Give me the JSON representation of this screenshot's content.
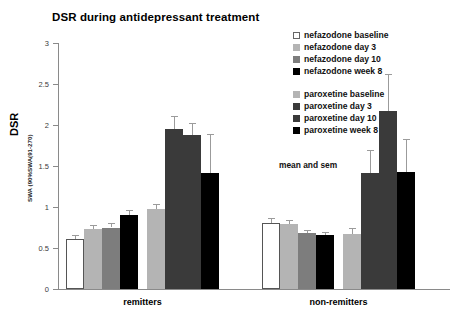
{
  "chart_data": {
    "type": "bar",
    "title": "DSR during antidepressant treatment",
    "xlabel": "",
    "ylabel": "DSR",
    "ylabel_sub": "SWA (90%SWA(91-270)",
    "ylim": [
      0,
      3
    ],
    "yticks": [
      "0",
      "0.5",
      "1",
      "1.5",
      "2",
      "2.5",
      "3"
    ],
    "ytick_values": [
      0,
      0.5,
      1,
      1.5,
      2,
      2.5,
      3
    ],
    "grid": false,
    "legend_position": "top-right",
    "annotation": "mean and sem",
    "categories": [
      "remitters",
      "non-remitters"
    ],
    "series": [
      {
        "name": "nefazodone baseline",
        "color": "#ffffff",
        "border": "#555555",
        "values": [
          0.61,
          0.8
        ],
        "errors": [
          0.05,
          0.06
        ]
      },
      {
        "name": "nefazodone day 3",
        "color": "#b4b4b4",
        "border": "#b4b4b4",
        "values": [
          0.73,
          0.79
        ],
        "errors": [
          0.05,
          0.05
        ]
      },
      {
        "name": "nefazodone day 10",
        "color": "#7d7d7d",
        "border": "#7d7d7d",
        "values": [
          0.75,
          0.68
        ],
        "errors": [
          0.05,
          0.04
        ]
      },
      {
        "name": "nefazodone week 8",
        "color": "#000000",
        "border": "#000000",
        "values": [
          0.9,
          0.66
        ],
        "errors": [
          0.06,
          0.04
        ]
      },
      {
        "name": "paroxetine baseline",
        "color": "#b4b4b4",
        "border": "#b4b4b4",
        "values": [
          0.98,
          0.67
        ],
        "errors": [
          0.06,
          0.07
        ]
      },
      {
        "name": "paroxetine day 3",
        "color": "#3a3a3a",
        "border": "#3a3a3a",
        "values": [
          1.95,
          1.42
        ],
        "errors": [
          0.16,
          0.28
        ]
      },
      {
        "name": "paroxetine day 10",
        "color": "#3a3a3a",
        "border": "#3a3a3a",
        "values": [
          1.88,
          2.17
        ],
        "errors": [
          0.14,
          0.45
        ]
      },
      {
        "name": "paroxetine week 8",
        "color": "#000000",
        "border": "#000000",
        "values": [
          1.42,
          1.43
        ],
        "errors": [
          0.47,
          0.4
        ]
      }
    ]
  },
  "legend": {
    "group_1": [
      {
        "label": "nefazodone baseline",
        "color": "#ffffff",
        "border": "#666666"
      },
      {
        "label": "nefazodone day 3",
        "color": "#b4b4b4",
        "border": "#b4b4b4"
      },
      {
        "label": "nefazodone day 10",
        "color": "#7d7d7d",
        "border": "#7d7d7d"
      },
      {
        "label": "nefazodone week 8",
        "color": "#000000",
        "border": "#000000"
      }
    ],
    "group_2": [
      {
        "label": "paroxetine baseline",
        "color": "#b4b4b4",
        "border": "#b4b4b4"
      },
      {
        "label": "paroxetine day 3",
        "color": "#3a3a3a",
        "border": "#3a3a3a"
      },
      {
        "label": "paroxetine day 10",
        "color": "#3a3a3a",
        "border": "#3a3a3a"
      },
      {
        "label": "paroxetine week 8",
        "color": "#000000",
        "border": "#000000"
      }
    ]
  }
}
